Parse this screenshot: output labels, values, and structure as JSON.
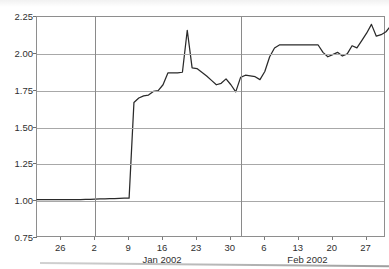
{
  "chart_data": {
    "type": "line",
    "title": "",
    "xlabel": "",
    "ylabel": "",
    "ylim": [
      0.75,
      2.25
    ],
    "y_ticks": [
      "0.75",
      "1.00",
      "1.25",
      "1.50",
      "1.75",
      "2.00",
      "2.25"
    ],
    "y_tick_values": [
      0.75,
      1.0,
      1.25,
      1.5,
      1.75,
      2.0,
      2.25
    ],
    "grid": true,
    "legend": "none",
    "x_tick_labels": [
      "26",
      "2",
      "9",
      "16",
      "23",
      "30",
      "6",
      "13",
      "20",
      "27"
    ],
    "x_tick_indices": [
      5,
      12,
      19,
      26,
      33,
      40,
      47,
      54,
      61,
      68
    ],
    "x_group_labels": [
      {
        "label": "Jan 2002",
        "index": 26
      },
      {
        "label": "Feb 2002",
        "index": 56
      }
    ],
    "month_boundary_indices": [
      12,
      42
    ],
    "x_index_range": [
      0,
      72
    ],
    "series": [
      {
        "name": "price",
        "values": [
          1.01,
          1.01,
          1.01,
          1.01,
          1.01,
          1.01,
          1.01,
          1.01,
          1.01,
          1.01,
          1.012,
          1.012,
          1.014,
          1.015,
          1.016,
          1.017,
          1.018,
          1.019,
          1.02,
          1.02,
          1.67,
          1.7,
          1.715,
          1.72,
          1.745,
          1.75,
          1.79,
          1.87,
          1.87,
          1.87,
          1.875,
          2.16,
          1.905,
          1.9,
          1.875,
          1.85,
          1.82,
          1.79,
          1.8,
          1.83,
          1.79,
          1.742,
          1.84,
          1.855,
          1.85,
          1.845,
          1.825,
          1.88,
          1.98,
          2.04,
          2.06,
          2.06,
          2.06,
          2.06,
          2.06,
          2.06,
          2.06,
          2.06,
          2.06,
          2.01,
          1.98,
          1.995,
          2.01,
          1.985,
          2.0,
          2.055,
          2.04,
          2.09,
          2.14,
          2.2,
          2.12,
          2.13,
          2.15,
          2.19,
          2.27,
          2.22
        ]
      }
    ]
  },
  "style": {
    "line_color": "#2a2a2a",
    "grid_color": "#a8a8a8",
    "frame_color": "#8e8e8e",
    "background": "#ffffff",
    "text_color": "#2f2f2f"
  }
}
